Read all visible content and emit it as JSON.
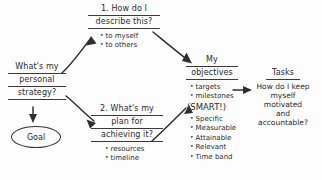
{
  "diagram": {
    "background_color": "#fdfdfd",
    "ink_color": "#2f2f2f",
    "nodes": {
      "start": {
        "name": "start-question",
        "lines": [
          "What's my",
          "personal",
          "strategy?"
        ]
      },
      "goal": {
        "name": "goal-oval",
        "label": "Goal"
      },
      "branch1": {
        "name": "branch-describe",
        "heading": [
          "1. How do I",
          "describe this?"
        ],
        "bullets": [
          "to myself",
          "to others"
        ]
      },
      "branch2": {
        "name": "branch-plan",
        "heading": [
          "2. What's my",
          "plan for",
          "achieving it?"
        ],
        "bullets": [
          "resources",
          "timeline"
        ]
      },
      "objectives": {
        "name": "objectives-node",
        "heading": [
          "My",
          "objectives"
        ],
        "bullets": [
          "targets",
          "milestones"
        ],
        "smart_tag": "(SMART!)",
        "smart_items": [
          "Specific",
          "Measurable",
          "Attainable",
          "Relevant",
          "Time band"
        ]
      },
      "tasks": {
        "name": "tasks-node",
        "heading": "Tasks",
        "body": [
          "How do I keep",
          "myself",
          "motivated",
          "and",
          "accountable?"
        ]
      }
    },
    "arrows": [
      {
        "name": "arrow-start-to-describe",
        "from": "start",
        "to": "branch1"
      },
      {
        "name": "arrow-start-to-plan",
        "from": "start",
        "to": "branch2"
      },
      {
        "name": "arrow-start-to-goal",
        "from": "start",
        "to": "goal"
      },
      {
        "name": "arrow-describe-to-objectives",
        "from": "branch1",
        "to": "objectives"
      },
      {
        "name": "arrow-plan-to-objectives",
        "from": "branch2",
        "to": "objectives"
      },
      {
        "name": "arrow-objectives-to-tasks",
        "from": "objectives",
        "to": "tasks"
      }
    ]
  }
}
